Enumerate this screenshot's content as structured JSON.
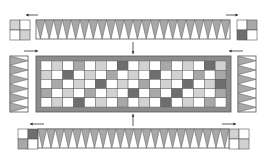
{
  "diagram": {
    "type": "quilt-assembly",
    "colors": {
      "white": "#ffffff",
      "light": "#d2d2d2",
      "medium": "#a8a8a8",
      "dark": "#6e6e6e",
      "frame": "#8c8c8c",
      "line": "#555555"
    },
    "center_panel": {
      "rows": 5,
      "cols": 17,
      "cells": [
        "WLWMWLWDWLWMWLWDL",
        "LWDWLWMWLWDWLWMWM",
        "WMWLWDWLWMWLWDWLD",
        "MWLWMWLWDWMWDWLWM",
        "WLWDWLWMWLWDWLWMW"
      ]
    },
    "top_border": {
      "triangles": 22
    },
    "bottom_border": {
      "triangles": 22
    },
    "left_border": {
      "triangles": 6
    },
    "right_border": {
      "triangles": 6
    },
    "corners": {
      "top_left": [
        "L",
        "W",
        "W",
        "L"
      ],
      "top_right": [
        "W",
        "M",
        "D",
        "W"
      ],
      "bottom_left": [
        "W",
        "D",
        "M",
        "W"
      ],
      "bottom_right": [
        "L",
        "W",
        "W",
        "L"
      ]
    },
    "arrows": [
      {
        "name": "top-left-arrow",
        "direction": "left"
      },
      {
        "name": "top-right-arrow",
        "direction": "right"
      },
      {
        "name": "left-side-arrow",
        "direction": "right"
      },
      {
        "name": "right-side-arrow",
        "direction": "left"
      },
      {
        "name": "center-top-arrow",
        "direction": "down"
      },
      {
        "name": "center-bottom-arrow",
        "direction": "up"
      },
      {
        "name": "bottom-left-arrow",
        "direction": "left"
      },
      {
        "name": "bottom-right-arrow",
        "direction": "right"
      }
    ]
  }
}
